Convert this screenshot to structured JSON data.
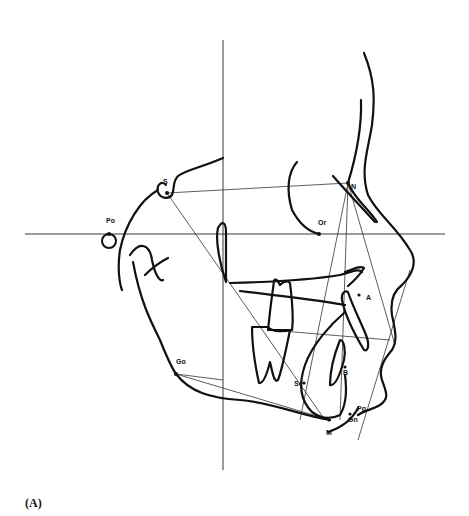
{
  "figure": {
    "caption": "(A)",
    "type": "cephalometric tracing",
    "landmarks": [
      {
        "id": "S",
        "label": "S",
        "x": 167,
        "y": 193
      },
      {
        "id": "Po",
        "label": "Po",
        "x": 109,
        "y": 233
      },
      {
        "id": "N",
        "label": "N",
        "x": 348,
        "y": 183
      },
      {
        "id": "Or",
        "label": "Or",
        "x": 319,
        "y": 234
      },
      {
        "id": "A",
        "label": "A",
        "x": 363,
        "y": 295
      },
      {
        "id": "B",
        "label": "B",
        "x": 341,
        "y": 368
      },
      {
        "id": "Go",
        "label": "Go",
        "x": 176,
        "y": 374
      },
      {
        "id": "Se",
        "label": "Se",
        "x": 305,
        "y": 385
      },
      {
        "id": "Pg",
        "label": "Pg",
        "x": 355,
        "y": 411
      },
      {
        "id": "Gn",
        "label": "Gn",
        "x": 342,
        "y": 419
      },
      {
        "id": "M",
        "label": "M",
        "x": 330,
        "y": 433
      }
    ]
  }
}
